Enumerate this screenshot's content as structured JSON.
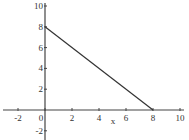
{
  "chart_data": {
    "type": "line",
    "title": "",
    "xlabel": "x",
    "ylabel": "",
    "xlim": [
      -3,
      10.3
    ],
    "ylim": [
      -3.2,
      10.3
    ],
    "grid": false,
    "legend": null,
    "x_ticks": [
      -2,
      0,
      2,
      4,
      6,
      8,
      10
    ],
    "y_ticks": [
      -2,
      2,
      4,
      6,
      8,
      10
    ],
    "x_tick_labels": [
      "-2",
      "0",
      "2",
      "4",
      "6",
      "8",
      "10"
    ],
    "y_tick_labels": [
      "-2",
      "2",
      "4",
      "6",
      "8",
      "10"
    ],
    "series": [
      {
        "name": "line",
        "x": [
          0,
          8
        ],
        "y": [
          8,
          0
        ],
        "color": "#333333"
      }
    ]
  }
}
